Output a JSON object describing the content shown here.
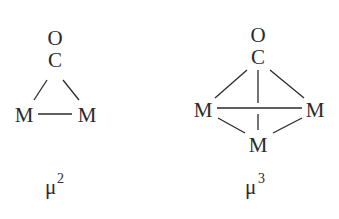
{
  "diagram": {
    "structures": [
      {
        "name": "mu2",
        "atoms": {
          "oxygen": "O",
          "carbon": "C",
          "metal_left": "M",
          "metal_right": "M"
        },
        "label": {
          "base": "μ",
          "superscript": "2"
        }
      },
      {
        "name": "mu3",
        "atoms": {
          "oxygen": "O",
          "carbon": "C",
          "metal_left": "M",
          "metal_right": "M",
          "metal_bottom": "M"
        },
        "label": {
          "base": "μ",
          "superscript": "3"
        }
      }
    ],
    "colors": {
      "ink": "#2a2a2a",
      "background": "#ffffff"
    }
  }
}
